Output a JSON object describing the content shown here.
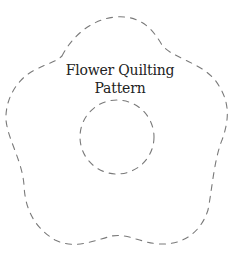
{
  "pattern": {
    "title_line1": "Flower Quilting",
    "title_line2": "Pattern",
    "stroke_color": "#777777",
    "background": "#ffffff",
    "outline_style": "dashed",
    "shapes": [
      {
        "name": "outer-flower-outline",
        "type": "five-lobed flower"
      },
      {
        "name": "inner-circle-outline",
        "type": "circle",
        "cx": 117,
        "cy": 137,
        "r": 37
      }
    ]
  }
}
